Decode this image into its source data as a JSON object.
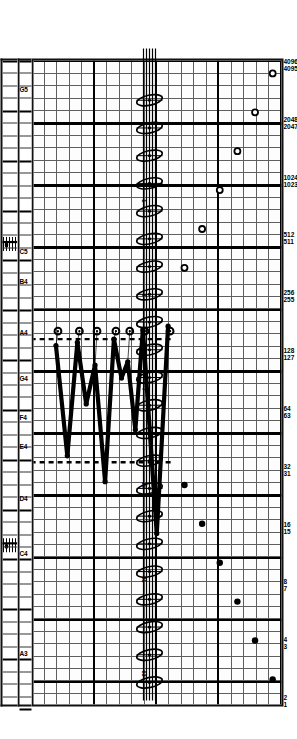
{
  "figure": {
    "title": "",
    "orientation": "rotated-90"
  },
  "chart_data": {
    "type": "scatter",
    "title": "",
    "xlabel": "",
    "ylabel": "",
    "grid": true,
    "legend": "none",
    "x_axis": {
      "scale": "log2",
      "tick_values": [
        2,
        4,
        8,
        16,
        32,
        64,
        128,
        256,
        512,
        1024,
        2048,
        4096
      ],
      "tick_labels": [
        "2",
        "4",
        "8",
        "16",
        "32",
        "64",
        "128",
        "256",
        "512",
        "1024",
        "2048",
        "4096"
      ],
      "secondary_tick_labels": [
        "1",
        "3",
        "7",
        "15",
        "31",
        "63",
        "127",
        "255",
        "511",
        "1023",
        "2047",
        "4095"
      ]
    },
    "note_axis": {
      "labels": [
        "G5",
        "C5",
        "B4",
        "A4",
        "G4",
        "F4",
        "E4",
        "D4",
        "C4",
        "A3"
      ],
      "label_positions_pct": [
        3.0,
        28.5,
        32.5,
        40.5,
        47.5,
        54.0,
        58.5,
        66.5,
        75.0,
        90.0
      ]
    },
    "series": [
      {
        "name": "upper-open-circles",
        "marker": "open-circle",
        "points_pct": [
          {
            "x": 2.0,
            "y": 3.5
          },
          {
            "x": 8.0,
            "y": 10.5
          },
          {
            "x": 14.0,
            "y": 17.5
          },
          {
            "x": 20.0,
            "y": 24.5
          },
          {
            "x": 26.0,
            "y": 31.5
          },
          {
            "x": 32.0,
            "y": 38.5
          }
        ]
      },
      {
        "name": "upper-filled-circles-a",
        "marker": "filled-circle",
        "points_pct": [
          {
            "x": 95.5,
            "y": 3.5
          },
          {
            "x": 89.5,
            "y": 10.5
          },
          {
            "x": 83.5,
            "y": 17.5
          },
          {
            "x": 77.5,
            "y": 24.5
          },
          {
            "x": 71.5,
            "y": 31.5
          },
          {
            "x": 65.5,
            "y": 38.5
          }
        ]
      },
      {
        "name": "zigzag-path",
        "marker": "line",
        "points_pct": [
          {
            "x": 41.0,
            "y": 45.0
          },
          {
            "x": 73.0,
            "y": 49.5
          },
          {
            "x": 41.5,
            "y": 55.0
          },
          {
            "x": 57.0,
            "y": 58.0
          },
          {
            "x": 46.5,
            "y": 61.0
          },
          {
            "x": 49.0,
            "y": 63.5
          },
          {
            "x": 43.0,
            "y": 66.5
          },
          {
            "x": 65.0,
            "y": 70.0
          },
          {
            "x": 47.0,
            "y": 74.0
          },
          {
            "x": 53.0,
            "y": 77.5
          },
          {
            "x": 43.5,
            "y": 81.0
          },
          {
            "x": 61.0,
            "y": 85.0
          },
          {
            "x": 44.0,
            "y": 89.5
          }
        ]
      }
    ],
    "dashed_guides_pct": [
      43.0,
      62.0
    ]
  },
  "axis_numbers": {
    "upper_row": [
      "4096",
      "2048",
      "1024",
      "512",
      "256",
      "128",
      "64",
      "32",
      "16",
      "8",
      "4",
      "2"
    ],
    "lower_row": [
      "4095",
      "2047",
      "1023",
      "511",
      "255",
      "127",
      "63",
      "31",
      "15",
      "7",
      "3",
      "1"
    ]
  },
  "note_names": {
    "items": [
      {
        "label": "G5",
        "pos": 3.0
      },
      {
        "label": "C5",
        "pos": 28.0
      },
      {
        "label": "B4",
        "pos": 32.5
      },
      {
        "label": "A4",
        "pos": 40.5
      },
      {
        "label": "G4",
        "pos": 47.5
      },
      {
        "label": "F4",
        "pos": 53.5
      },
      {
        "label": "E4",
        "pos": 58.0
      },
      {
        "label": "D4",
        "pos": 66.0
      },
      {
        "label": "C4",
        "pos": 74.5
      },
      {
        "label": "A3",
        "pos": 90.0
      }
    ]
  },
  "stave_notes": {
    "count": 22,
    "labels": [
      "63",
      "31",
      "15",
      "7",
      "3",
      "1"
    ]
  }
}
